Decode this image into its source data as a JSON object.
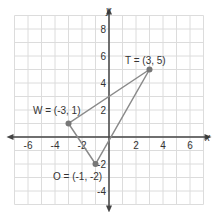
{
  "chart_data": {
    "type": "scatter",
    "title": "",
    "xlabel": "x",
    "ylabel": "y",
    "xlim": [
      -7,
      7
    ],
    "ylim": [
      -5,
      9
    ],
    "grid": true,
    "x_ticks": [
      -6,
      -4,
      -2,
      2,
      4,
      6
    ],
    "y_ticks": [
      -4,
      -2,
      2,
      4,
      6,
      8
    ],
    "x_tick_labels": [
      "-6",
      "-4",
      "-2",
      "2",
      "4",
      "6"
    ],
    "y_tick_labels": [
      "-4",
      "-2",
      "2",
      "4",
      "6",
      "8"
    ],
    "points": [
      {
        "name": "T",
        "x": 3,
        "y": 5,
        "label": "T = (3, 5)"
      },
      {
        "name": "W",
        "x": -3,
        "y": 1,
        "label": "W = (-3, 1)"
      },
      {
        "name": "O",
        "x": -1,
        "y": -2,
        "label": "O = (-1, -2)"
      }
    ],
    "polygon": [
      "T",
      "W",
      "O"
    ]
  },
  "labels": {
    "x_axis": "x",
    "y_axis": "y",
    "T": "T = (3, 5)",
    "W": "W = (-3, 1)",
    "O": "O = (-1, -2)"
  },
  "colors": {
    "grid": "#dcdcdc",
    "axis": "#444444",
    "triangle": "#8a8a8a",
    "point": "#777777"
  }
}
